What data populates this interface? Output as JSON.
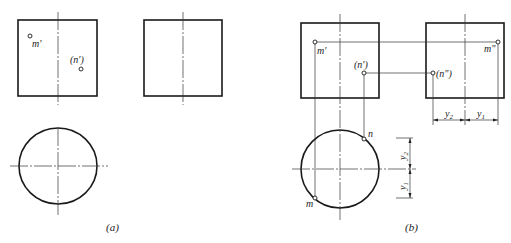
{
  "figure": {
    "panel_a": {
      "caption": "(a)",
      "front_view": {
        "label_m": "m'",
        "label_n": "(n')"
      },
      "side_view": {},
      "top_view": {}
    },
    "panel_b": {
      "caption": "(b)",
      "front_view": {
        "label_m": "m'",
        "label_n": "(n')"
      },
      "side_view": {
        "label_m": "m\"",
        "label_n": "(n\")"
      },
      "top_view": {
        "label_m": "m",
        "label_n": "n"
      },
      "dimensions": {
        "horizontal": {
          "left": "y",
          "left_sub": "2",
          "right": "y",
          "right_sub": "1"
        },
        "vertical": {
          "top": "y",
          "top_sub": "2",
          "bottom": "y",
          "bottom_sub": "1"
        }
      }
    },
    "colors": {
      "line": "#1a1a1a",
      "background": "#ffffff"
    }
  }
}
